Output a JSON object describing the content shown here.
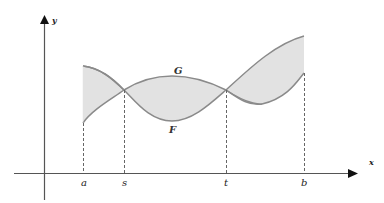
{
  "diagram": {
    "axes": {
      "x_label": "x",
      "y_label": "y"
    },
    "curves": [
      {
        "name": "G",
        "label": "G"
      },
      {
        "name": "F",
        "label": "F"
      }
    ],
    "x_ticks": [
      {
        "label": "a"
      },
      {
        "label": "s"
      },
      {
        "label": "t"
      },
      {
        "label": "b"
      }
    ],
    "colors": {
      "shade": "#e2e2e2",
      "curve": "#8a8a8a",
      "axis": "#555555",
      "dash": "#666666"
    }
  }
}
